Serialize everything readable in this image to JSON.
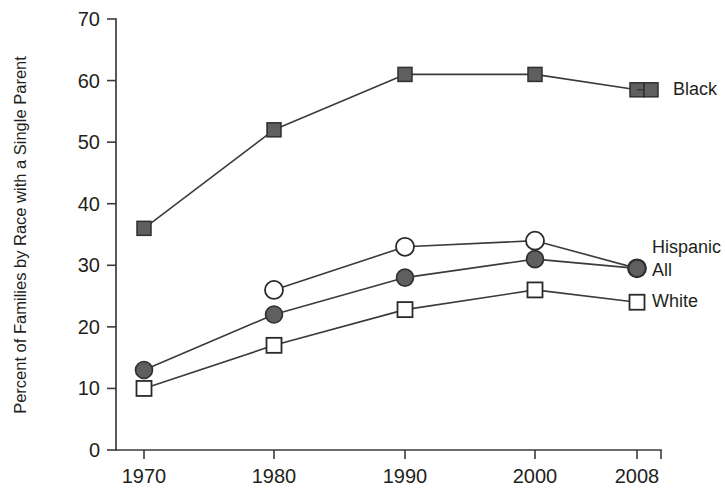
{
  "chart_data": {
    "type": "line",
    "title": "",
    "xlabel": "",
    "ylabel": "Percent of Families by Race with a Single Parent",
    "x": [
      1970,
      1980,
      1990,
      2000,
      2008
    ],
    "categories": [
      "1970",
      "1980",
      "1990",
      "2000",
      "2008"
    ],
    "xtick_labels": [
      "1970",
      "1980",
      "1990",
      "2000",
      "2008"
    ],
    "ytick_labels": [
      "0",
      "10",
      "20",
      "30",
      "40",
      "50",
      "60",
      "70"
    ],
    "ytick_values": [
      0,
      10,
      20,
      30,
      40,
      50,
      60,
      70
    ],
    "ylim": [
      0,
      70
    ],
    "xlim": [
      1966,
      2011
    ],
    "grid": false,
    "legend_position": "right-inline",
    "series": [
      {
        "name": "Black",
        "marker": "filled-square",
        "color": "#5f5f5f",
        "values": [
          36,
          52,
          61,
          61,
          58.5
        ],
        "x": [
          1970,
          1980,
          1990,
          2000,
          2008
        ]
      },
      {
        "name": "Hispanic",
        "marker": "open-circle",
        "color": "#ffffff",
        "values": [
          26,
          33,
          34,
          29.5
        ],
        "x": [
          1980,
          1990,
          2000,
          2008
        ]
      },
      {
        "name": "All",
        "marker": "filled-circle",
        "color": "#5f5f5f",
        "values": [
          13,
          22,
          28,
          31,
          29.5
        ],
        "x": [
          1970,
          1980,
          1990,
          2000,
          2008
        ]
      },
      {
        "name": "White",
        "marker": "open-square",
        "color": "#ffffff",
        "values": [
          10,
          17,
          22.8,
          26,
          24
        ],
        "x": [
          1970,
          1980,
          1990,
          2000,
          2008
        ]
      }
    ],
    "legend": [
      {
        "label": "Black",
        "marker": "filled-square"
      },
      {
        "label": "Hispanic",
        "marker": "none"
      },
      {
        "label": "All",
        "marker": "open-circle"
      },
      {
        "label": "White",
        "marker": "open-square"
      }
    ]
  },
  "axes": {
    "y_title": "Percent of Families by Race with a Single Parent"
  },
  "colors": {
    "axis": "#3b3b3b",
    "text": "#231f20",
    "marker_fill": "#5f5f5f",
    "marker_stroke": "#2a2a2a",
    "background": "#ffffff"
  }
}
